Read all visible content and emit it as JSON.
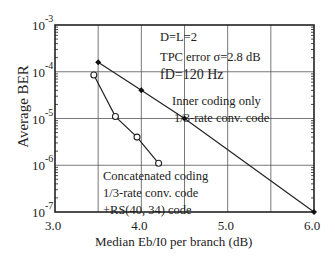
{
  "chart_data": {
    "type": "line",
    "title": "",
    "xlabel": "Median Eb/I0 per branch  (dB)",
    "ylabel": "Average BER",
    "xlim": [
      3.0,
      6.0
    ],
    "ylim": [
      1e-07,
      0.001
    ],
    "yscale": "log",
    "grid": true,
    "x_ticks": [
      "3.0",
      "4.0",
      "5.0",
      "6.0"
    ],
    "y_ticks": [
      {
        "base": "10",
        "exp": "-3"
      },
      {
        "base": "10",
        "exp": "-4"
      },
      {
        "base": "10",
        "exp": "-5"
      },
      {
        "base": "10",
        "exp": "-6"
      },
      {
        "base": "10",
        "exp": "-7"
      }
    ],
    "series": [
      {
        "name": "Inner coding only 1/3-rate conv. code",
        "marker": "filled-diamond",
        "x": [
          3.5,
          4.0,
          4.5,
          6.0
        ],
        "y": [
          0.00016,
          4e-05,
          1e-05,
          1e-07
        ]
      },
      {
        "name": "Concatenated coding 1/3-rate conv. code +RS(40, 34) code",
        "marker": "open-circle",
        "x": [
          3.45,
          3.7,
          3.95,
          4.2
        ],
        "y": [
          8.5e-05,
          1.1e-05,
          4e-06,
          1.1e-06
        ]
      }
    ],
    "annotations": [
      "D=L=2",
      "TPC error  σ=2.8 dB",
      "fD=120 Hz",
      "Inner coding only",
      "1/3-rate conv. code",
      "Concatenated coding",
      "1/3-rate conv. code",
      "+RS(40, 34) code"
    ]
  },
  "labels": {
    "params": [
      "D=L=2",
      "TPC error  σ=2.8 dB",
      "fD=120 Hz"
    ],
    "inner": [
      "Inner coding only",
      "1/3-rate conv. code"
    ],
    "concat": [
      "Concatenated coding",
      "1/3-rate conv. code",
      "+RS(40, 34) code"
    ]
  }
}
